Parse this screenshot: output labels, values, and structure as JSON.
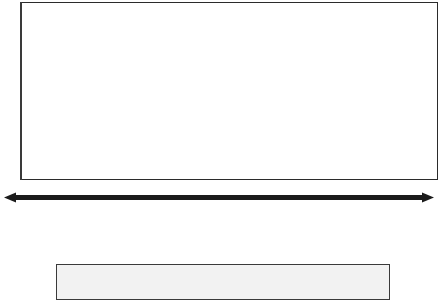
{
  "chart_data": {
    "type": "line",
    "title": "",
    "xlabel": "",
    "ylabel": "",
    "xlim": [
      1999,
      2010
    ],
    "ylim": [
      0,
      100
    ],
    "grid": true,
    "legend_position": "bottom",
    "axis_style": "arrow-left-right",
    "xticks": [
      "1999",
      "2000",
      "2001",
      "2002",
      "2003",
      "2004",
      "2005",
      "2006",
      "2007",
      "2008",
      "2009",
      "2010"
    ],
    "legend": [
      {
        "label": "Blogging",
        "marker": "circle-filled"
      },
      {
        "label": "Media sharing",
        "marker": "diamond-open"
      },
      {
        "label": "Microblogging",
        "marker": "star-open"
      },
      {
        "label": "Podcasting",
        "marker": "diamond-filled"
      },
      {
        "label": "RSS agregation",
        "marker": "star-filled"
      },
      {
        "label": "Social media",
        "marker": "square-open"
      },
      {
        "label": "Social networks",
        "marker": "circle-filled"
      },
      {
        "label": "Virtual worlds",
        "marker": "square-filled"
      },
      {
        "label": "Wikis",
        "marker": "circle-open"
      }
    ],
    "points": [
      {
        "label": "Blogger",
        "x": 1999.02,
        "y": 3,
        "marker": "circle-filled",
        "size": 9
      },
      {
        "label": "Wikipedia",
        "x": 1999.33,
        "y": 7,
        "marker": "circle-open",
        "size": 7
      },
      {
        "label": "Innocentive",
        "x": 1999.7,
        "y": 11,
        "marker": "circle-filled",
        "size": 7
      },
      {
        "label": "MIT Open Courseware",
        "x": 2000.18,
        "y": 22,
        "marker": "diamond-filled",
        "size": 9
      },
      {
        "label": "Plaxo",
        "x": 2000.52,
        "y": 25,
        "marker": "circle-filled",
        "size": 7
      },
      {
        "label": "LinkedIn",
        "x": 2000.92,
        "y": 32,
        "marker": "circle-filled",
        "size": 7
      },
      {
        "label": "Second Life",
        "x": 2001.28,
        "y": 35,
        "marker": "square-filled",
        "size": 8
      },
      {
        "label": "Skype",
        "x": 2001.58,
        "y": 35,
        "marker": "square-filled",
        "size": 8
      },
      {
        "label": "MySpace",
        "x": 2001.92,
        "y": 36,
        "marker": "circle-filled",
        "size": 7
      },
      {
        "label": "Delicious",
        "x": 2002.26,
        "y": 37,
        "marker": "diamond-open",
        "size": 8
      },
      {
        "label": "Flickr",
        "x": 2002.62,
        "y": 41,
        "marker": "star-open",
        "size": 9
      },
      {
        "label": "Facebook",
        "x": 2003.04,
        "y": 42,
        "marker": "circle-filled",
        "size": 7
      },
      {
        "label": "Digg",
        "x": 2003.4,
        "y": 48,
        "marker": "diamond-open",
        "size": 8
      },
      {
        "label": "World of Warcraft",
        "x": 2003.7,
        "y": 50,
        "marker": "square-filled",
        "size": 9
      },
      {
        "label": "YouTube",
        "x": 2004.04,
        "y": 53,
        "marker": "star-filled",
        "size": 9
      },
      {
        "label": "iGoogle",
        "x": 2004.36,
        "y": 55,
        "marker": "circle-filled",
        "size": 7
      },
      {
        "label": "Mashable",
        "x": 2004.7,
        "y": 58,
        "marker": "star-open",
        "size": 9
      },
      {
        "label": "Pandora",
        "x": 2005.04,
        "y": 58,
        "marker": "circle-filled",
        "size": 7
      },
      {
        "label": "Ning",
        "x": 2005.4,
        "y": 60,
        "marker": "circle-filled",
        "size": 7
      },
      {
        "label": "Wordpress",
        "x": 2005.72,
        "y": 63,
        "marker": "star-open",
        "size": 9
      },
      {
        "label": "Wetpaint",
        "x": 2006.02,
        "y": 66,
        "marker": "circle-open",
        "size": 7
      },
      {
        "label": "Twitter",
        "x": 2006.32,
        "y": 68,
        "marker": "circle-filled",
        "size": 10
      },
      {
        "label": "Loopt",
        "x": 2006.7,
        "y": 70,
        "marker": "circle-filled",
        "size": 7
      },
      {
        "label": "Google Documents",
        "x": 2007.0,
        "y": 71,
        "marker": "star-open",
        "size": 9
      },
      {
        "label": "iTunes University",
        "x": 2007.38,
        "y": 77,
        "marker": "diamond-filled",
        "size": 9
      },
      {
        "label": "Fellowforce",
        "x": 2007.68,
        "y": 78,
        "marker": "circle-filled",
        "size": 7
      },
      {
        "label": "Friendfeed",
        "x": 2008.0,
        "y": 81,
        "marker": "circle-filled",
        "size": 7
      },
      {
        "label": "Crowdspring",
        "x": 2008.32,
        "y": 84,
        "marker": "star-filled",
        "size": 9
      },
      {
        "label": "Yammer",
        "x": 2008.72,
        "y": 87,
        "marker": "circle-filled",
        "size": 7
      },
      {
        "label": "Yookly",
        "x": 2009.08,
        "y": 90,
        "marker": "diamond-open",
        "size": 8
      },
      {
        "label": "Rypple",
        "x": 2009.44,
        "y": 91,
        "marker": "star-open",
        "size": 9
      },
      {
        "label": "Bing",
        "x": 2009.85,
        "y": 97,
        "marker": "square-filled",
        "size": 9
      }
    ]
  }
}
